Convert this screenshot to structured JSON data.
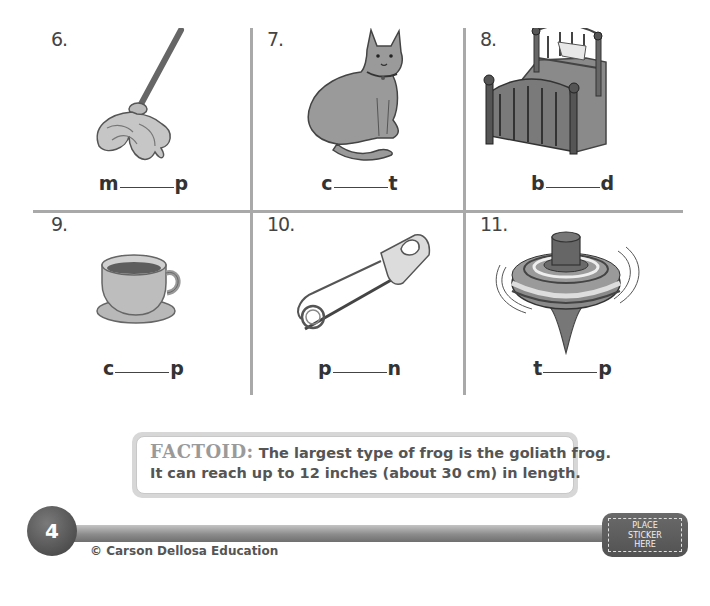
{
  "worksheet": {
    "items": [
      {
        "number": "6.",
        "picture": "mop",
        "first_letter": "m",
        "last_letter": "p"
      },
      {
        "number": "7.",
        "picture": "cat",
        "first_letter": "c",
        "last_letter": "t"
      },
      {
        "number": "8.",
        "picture": "bed",
        "first_letter": "b",
        "last_letter": "d"
      },
      {
        "number": "9.",
        "picture": "cup",
        "first_letter": "c",
        "last_letter": "p"
      },
      {
        "number": "10.",
        "picture": "safety-pin",
        "first_letter": "p",
        "last_letter": "n"
      },
      {
        "number": "11.",
        "picture": "spinning-top",
        "first_letter": "t",
        "last_letter": "p"
      }
    ]
  },
  "factoid": {
    "label": "FACTOID:",
    "line1": "The largest type of frog is the goliath frog.",
    "line2": "It can reach up to 12 inches (about 30 cm) in length."
  },
  "footer": {
    "page_number": "4",
    "copyright": "© Carson Dellosa Education",
    "sticker_lines": [
      "PLACE",
      "STICKER",
      "HERE"
    ]
  },
  "colors": {
    "grid_line": "#a9a9a9",
    "badge": "#555555",
    "text": "#333333"
  }
}
